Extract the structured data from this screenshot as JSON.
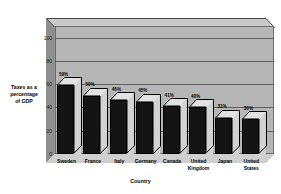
{
  "chart_data": {
    "type": "bar",
    "title": "",
    "xlabel": "Country",
    "ylabel": "Taxes as a percentage of GDP",
    "ylabel_lines": [
      "Taxes as a",
      "percentage",
      "of GDP"
    ],
    "categories": [
      "Sweden",
      "France",
      "Italy",
      "Germany",
      "Canada",
      "United Kingdom",
      "Japan",
      "United States"
    ],
    "category_lines": [
      [
        "Sweden"
      ],
      [
        "France"
      ],
      [
        "Italy"
      ],
      [
        "Germany"
      ],
      [
        "Canada"
      ],
      [
        "United",
        "Kingdom"
      ],
      [
        "Japan"
      ],
      [
        "United",
        "States"
      ]
    ],
    "values": [
      59,
      50,
      46,
      45,
      41,
      40,
      31,
      30
    ],
    "data_labels": [
      "59%",
      "50%",
      "46%",
      "45%",
      "41%",
      "40%",
      "31%",
      "30%"
    ],
    "ylim": [
      0,
      110
    ],
    "yticks": [
      0,
      20,
      40,
      60,
      80,
      100
    ],
    "ytick_labels": [
      "0",
      "20",
      "40",
      "60",
      "80",
      "100"
    ],
    "grid": true,
    "legend": "none",
    "style": "3d-column",
    "colors": {
      "bar_front": "#141414",
      "bar_side": "#d2d2d2",
      "bar_top": "#e2e2e2",
      "back_wall": "#b6b6b6",
      "floor": "#cfcfcf",
      "left_wall": "#8f8f8f",
      "gridline": "#5f5f5f",
      "text": "#000000",
      "background": "#ffffff"
    }
  }
}
